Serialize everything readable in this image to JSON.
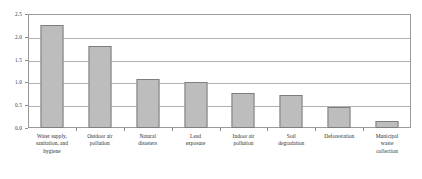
{
  "chart_data": {
    "type": "bar",
    "title": "",
    "subtitle": "",
    "xlabel": "",
    "ylabel": "",
    "ylim": [
      0.0,
      2.5
    ],
    "ytick_labels": [
      "0.0",
      "0.5",
      "1.0",
      "1.5",
      "2.0",
      "2.5"
    ],
    "ytick_values": [
      0.0,
      0.5,
      1.0,
      1.5,
      2.0,
      2.5
    ],
    "grid": true,
    "legend": "none",
    "categories": [
      "Water supply, sanitation, and hygiene",
      "Outdoor air pollution",
      "Natural disasters",
      "Lead exposure",
      "Indoor air pollution",
      "Soil degradation",
      "Deforestation",
      "Municipal waste collection"
    ],
    "category_lines": [
      [
        "Water supply,",
        "sanitation, and",
        "hygiene"
      ],
      [
        "Outdoor air",
        "pollution"
      ],
      [
        "Natural",
        "disasters"
      ],
      [
        "Lead",
        "exposure"
      ],
      [
        "Indoor air",
        "pollution"
      ],
      [
        "Soil",
        "degradation"
      ],
      [
        "Deforestation"
      ],
      [
        "Municipal",
        "waste",
        "collection"
      ]
    ],
    "values": [
      2.27,
      1.8,
      1.08,
      1.0,
      0.77,
      0.72,
      0.45,
      0.15
    ],
    "colors": {
      "bar_fill": "#bdbdbd",
      "bar_border": "#7e7e7e",
      "gridline": "#b0b0b0",
      "frame": "#9a9a9a",
      "text": "#2e2e2e",
      "background": "#ffffff"
    }
  }
}
